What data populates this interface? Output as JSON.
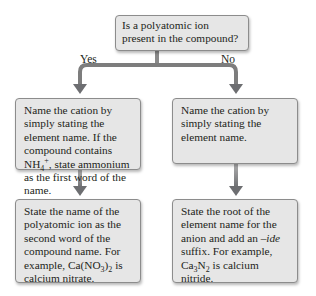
{
  "diagram": {
    "question": "Is a polyatomic ion present in the compound?",
    "branches": {
      "yes_label": "Yes",
      "no_label": "No"
    },
    "yes_path": {
      "step1": {
        "text_a": "Name the cation by simply stating the element name. If the compound contains NH",
        "sub": "4",
        "sup": "+",
        "text_b": ", state ammonium as the first word of the name."
      },
      "step2": {
        "text_a": "State the name of the polyatomic ion as the second word of the compound name. For example, Ca(NO",
        "sub1": "3",
        "text_b": ")",
        "sub2": "2",
        "text_c": " is calcium nitrate."
      }
    },
    "no_path": {
      "step1": {
        "text": "Name the cation by simply stating the element name."
      },
      "step2": {
        "text_a": "State the root of the element name for the anion and add an ",
        "em": "–ide",
        "text_b": " suffix. For example, Ca",
        "sub1": "3",
        "text_c": "N",
        "sub2": "2",
        "text_d": " is calcium nitride."
      }
    },
    "colors": {
      "box_fill": "#e6e6e6",
      "box_border": "#8c8c8c",
      "arrow": "#6d6e71"
    }
  }
}
